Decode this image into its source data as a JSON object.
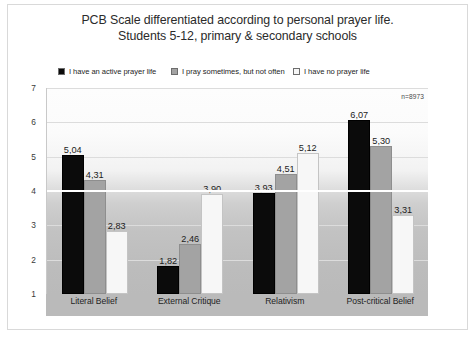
{
  "chart_data": {
    "type": "bar",
    "title": "PCB Scale differentiated according to personal prayer life. Students 5-12, primary & secondary schools",
    "title_lines": [
      "PCB Scale differentiated according to personal prayer life.",
      "Students 5-12, primary & secondary schools"
    ],
    "xlabel": "",
    "ylabel": "",
    "ylim": [
      1,
      7
    ],
    "yticks": [
      "7",
      "6",
      "5",
      "4",
      "3",
      "2",
      "1"
    ],
    "grid": true,
    "legend_position": "top",
    "annotation": "n=8973",
    "reference_line": 4,
    "categories": [
      "Literal Belief",
      "External Critique",
      "Relativism",
      "Post-critical Belief"
    ],
    "series": [
      {
        "name": "I have an active prayer life",
        "color": "#0b0b0b",
        "values": [
          5.04,
          1.82,
          3.93,
          6.07
        ],
        "labels": [
          "5,04",
          "1,82",
          "3,93",
          "6,07"
        ]
      },
      {
        "name": "I pray sometimes, but not often",
        "color": "#a3a3a3",
        "values": [
          4.31,
          2.46,
          4.51,
          5.3
        ],
        "labels": [
          "4,31",
          "2,46",
          "4,51",
          "5,30"
        ]
      },
      {
        "name": "I have no prayer life",
        "color": "#f7f7f7",
        "values": [
          2.83,
          3.9,
          5.12,
          3.31
        ],
        "labels": [
          "2,83",
          "3,90",
          "5,12",
          "3,31"
        ]
      }
    ]
  }
}
